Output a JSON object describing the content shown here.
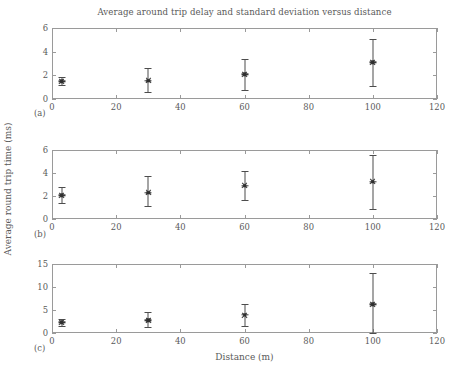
{
  "chart_data": {
    "type": "scatter",
    "title": "Average around trip delay and standard deviation versus distance",
    "xlabel": "Distance (m)",
    "ylabel": "Average round trip time (ms)",
    "grid": false,
    "legend": "none",
    "marker_style": "asterisk-with-error-bars",
    "xlim": [
      0,
      120
    ],
    "xticks": [
      0,
      20,
      40,
      60,
      80,
      100,
      120
    ],
    "xticklabels": [
      "0",
      "20",
      "40",
      "60",
      "80",
      "100",
      "120"
    ],
    "panels": [
      {
        "tag": "(a)",
        "ylim": [
          0,
          6
        ],
        "yticks": [
          0,
          2,
          4,
          6
        ],
        "yticklabels": [
          "0",
          "2",
          "4",
          "6"
        ],
        "x": [
          3,
          30,
          60,
          100
        ],
        "y": [
          1.5,
          1.55,
          2.1,
          3.1
        ],
        "yerr_low": [
          1.15,
          0.6,
          0.8,
          1.1
        ],
        "yerr_high": [
          1.9,
          2.6,
          3.4,
          5.1
        ]
      },
      {
        "tag": "(b)",
        "ylim": [
          0,
          6
        ],
        "yticks": [
          0,
          2,
          4,
          6
        ],
        "yticklabels": [
          "0",
          "2",
          "4",
          "6"
        ],
        "x": [
          3,
          30,
          60,
          100
        ],
        "y": [
          2.05,
          2.3,
          2.9,
          3.25
        ],
        "yerr_low": [
          1.4,
          1.1,
          1.65,
          0.85
        ],
        "yerr_high": [
          2.75,
          3.75,
          4.2,
          5.6
        ]
      },
      {
        "tag": "(c)",
        "ylim": [
          0,
          15
        ],
        "yticks": [
          0,
          5,
          10,
          15
        ],
        "yticklabels": [
          "0",
          "5",
          "10",
          "15"
        ],
        "x": [
          3,
          30,
          60,
          100
        ],
        "y": [
          2.3,
          2.8,
          3.9,
          6.2
        ],
        "yerr_low": [
          1.5,
          1.2,
          1.5,
          0.0
        ],
        "yerr_high": [
          3.1,
          4.6,
          6.2,
          13.0
        ]
      }
    ]
  },
  "colors": {
    "axis": "#9a9a9a",
    "text": "#5a5a5a",
    "marker": "#3a3a3a",
    "background": "#ffffff"
  }
}
